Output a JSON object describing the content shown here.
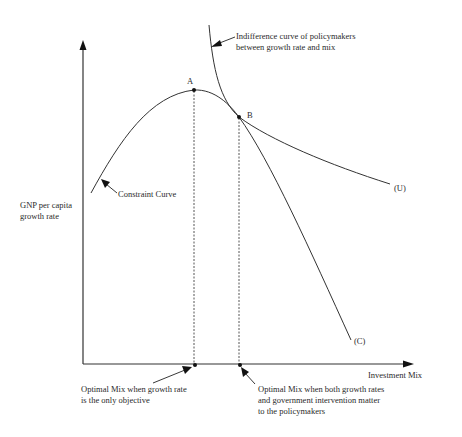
{
  "diagram": {
    "type": "economics-curve-diagram",
    "axes": {
      "y_label_line1": "GNP per capita",
      "y_label_line2": "growth rate",
      "x_label": "Investment Mix"
    },
    "curves": {
      "constraint": {
        "name": "Constraint Curve",
        "end_label": "(C)"
      },
      "indifference": {
        "annotation_line1": "Indifference curve of policymakers",
        "annotation_line2": "between growth rate and mix",
        "end_label": "(U)"
      }
    },
    "points": {
      "A": "A",
      "B": "B"
    },
    "annotations": {
      "optimal_growth_line1": "Optimal Mix when growth rate",
      "optimal_growth_line2": "is the only objective",
      "optimal_both_line1": "Optimal Mix when both growth rates",
      "optimal_both_line2": "and government intervention matter",
      "optimal_both_line3": "to the policymakers"
    },
    "colors": {
      "line": "#333333",
      "text": "#2a2a2a",
      "background": "#ffffff"
    }
  }
}
